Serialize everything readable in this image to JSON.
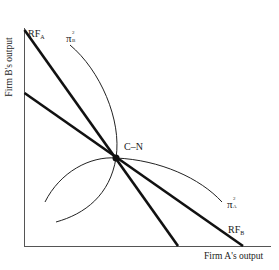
{
  "axes": {
    "x_label": "Firm A's output",
    "y_label": "Firm B's output"
  },
  "labels": {
    "rf_a": {
      "main": "RF",
      "sub": "A"
    },
    "rf_b": {
      "main": "RF",
      "sub": "B"
    },
    "pi_a": {
      "main": "π",
      "sup": "2",
      "sub": "A"
    },
    "pi_b": {
      "main": "π",
      "sup": "2",
      "sub": "B"
    },
    "equilibrium": "C–N"
  },
  "colors": {
    "line": "#111111",
    "axis": "#555555",
    "curve": "#222222"
  }
}
